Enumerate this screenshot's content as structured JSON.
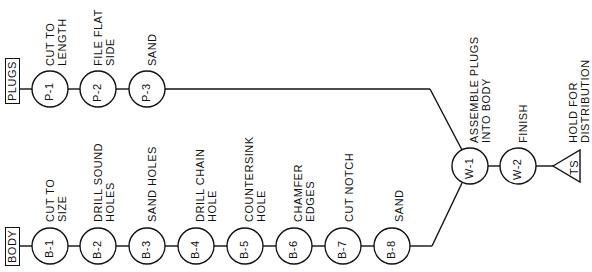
{
  "diagram": {
    "type": "operation-process-chart",
    "orientation": "rotated-90-ccw",
    "lines": {
      "plugs": {
        "label": "PLUGS",
        "operations": [
          {
            "id": "P-1",
            "description": [
              "CUT TO",
              "LENGTH"
            ]
          },
          {
            "id": "P-2",
            "description": [
              "FILE  FLAT",
              "SIDE"
            ]
          },
          {
            "id": "P-3",
            "description": [
              "SAND"
            ]
          }
        ]
      },
      "body": {
        "label": "BODY",
        "operations": [
          {
            "id": "B-1",
            "description": [
              "CUT TO",
              "SIZE"
            ]
          },
          {
            "id": "B-2",
            "description": [
              "DRILL  SOUND",
              "HOLES"
            ]
          },
          {
            "id": "B-3",
            "description": [
              "SAND  HOLES"
            ]
          },
          {
            "id": "B-4",
            "description": [
              "DRILL  CHAIN",
              "HOLE"
            ]
          },
          {
            "id": "B-5",
            "description": [
              "COUNTERSINK",
              "HOLE"
            ]
          },
          {
            "id": "B-6",
            "description": [
              "CHAMFER",
              "EDGES"
            ]
          },
          {
            "id": "B-7",
            "description": [
              "CUT  NOTCH"
            ]
          },
          {
            "id": "B-8",
            "description": [
              "SAND"
            ]
          }
        ]
      },
      "assembly": {
        "operations": [
          {
            "id": "W-1",
            "description": [
              "ASSEMBLE  PLUGS",
              "INTO  BODY"
            ]
          },
          {
            "id": "W-2",
            "description": [
              "FINISH"
            ]
          }
        ],
        "storage": {
          "id": "TS",
          "description": [
            "HOLD  FOR",
            "DISTRIBUTION"
          ]
        }
      }
    }
  }
}
